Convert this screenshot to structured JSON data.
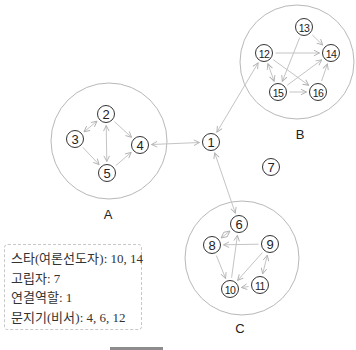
{
  "diagram": {
    "colors": {
      "edge": "#c4c4c4",
      "group_circle": "#b8b8b8",
      "node_stroke": "#333333",
      "text": "#222222"
    },
    "groups": [
      {
        "id": "A",
        "label": "A",
        "cx": 109,
        "cy": 141,
        "r": 58,
        "label_x": 108,
        "label_y": 219
      },
      {
        "id": "B",
        "label": "B",
        "cx": 297,
        "cy": 62,
        "r": 57,
        "label_x": 300,
        "label_y": 139
      },
      {
        "id": "C",
        "label": "C",
        "cx": 242,
        "cy": 258,
        "r": 57,
        "label_x": 240,
        "label_y": 333
      }
    ],
    "nodes": [
      {
        "id": "1",
        "label": "1",
        "x": 211,
        "y": 142
      },
      {
        "id": "2",
        "label": "2",
        "x": 106,
        "y": 114
      },
      {
        "id": "3",
        "label": "3",
        "x": 75,
        "y": 139
      },
      {
        "id": "4",
        "label": "4",
        "x": 140,
        "y": 145
      },
      {
        "id": "5",
        "label": "5",
        "x": 107,
        "y": 173
      },
      {
        "id": "6",
        "label": "6",
        "x": 239,
        "y": 224
      },
      {
        "id": "7",
        "label": "7",
        "x": 271,
        "y": 167
      },
      {
        "id": "8",
        "label": "8",
        "x": 212,
        "y": 245
      },
      {
        "id": "9",
        "label": "9",
        "x": 270,
        "y": 244
      },
      {
        "id": "10",
        "label": "10",
        "x": 230,
        "y": 289
      },
      {
        "id": "11",
        "label": "11",
        "x": 260,
        "y": 285
      },
      {
        "id": "12",
        "label": "12",
        "x": 264,
        "y": 53
      },
      {
        "id": "13",
        "label": "13",
        "x": 304,
        "y": 27
      },
      {
        "id": "14",
        "label": "14",
        "x": 331,
        "y": 53
      },
      {
        "id": "15",
        "label": "15",
        "x": 278,
        "y": 92
      },
      {
        "id": "16",
        "label": "16",
        "x": 318,
        "y": 92
      }
    ],
    "edges": [
      {
        "from": "3",
        "to": "2",
        "bidirectional": true
      },
      {
        "from": "2",
        "to": "5",
        "bidirectional": true
      },
      {
        "from": "2",
        "to": "4",
        "bidirectional": false
      },
      {
        "from": "3",
        "to": "5",
        "bidirectional": false
      },
      {
        "from": "5",
        "to": "4",
        "bidirectional": false
      },
      {
        "from": "1",
        "to": "4",
        "bidirectional": true
      },
      {
        "from": "1",
        "to": "12",
        "bidirectional": true
      },
      {
        "from": "1",
        "to": "6",
        "bidirectional": true
      },
      {
        "from": "13",
        "to": "14",
        "bidirectional": false
      },
      {
        "from": "13",
        "to": "15",
        "bidirectional": false
      },
      {
        "from": "12",
        "to": "14",
        "bidirectional": false
      },
      {
        "from": "12",
        "to": "16",
        "bidirectional": false
      },
      {
        "from": "12",
        "to": "15",
        "bidirectional": true
      },
      {
        "from": "15",
        "to": "14",
        "bidirectional": false
      },
      {
        "from": "15",
        "to": "16",
        "bidirectional": false
      },
      {
        "from": "16",
        "to": "14",
        "bidirectional": false
      },
      {
        "from": "8",
        "to": "6",
        "bidirectional": true
      },
      {
        "from": "9",
        "to": "8",
        "bidirectional": false
      },
      {
        "from": "10",
        "to": "6",
        "bidirectional": false
      },
      {
        "from": "8",
        "to": "10",
        "bidirectional": false
      },
      {
        "from": "9",
        "to": "10",
        "bidirectional": false
      },
      {
        "from": "9",
        "to": "11",
        "bidirectional": true
      },
      {
        "from": "11",
        "to": "10",
        "bidirectional": false
      }
    ]
  },
  "legend": {
    "lines": [
      "스타(여론선도자): 10, 14",
      "고립자: 7",
      "연결역할: 1",
      "문지기(비서): 4, 6, 12"
    ]
  }
}
